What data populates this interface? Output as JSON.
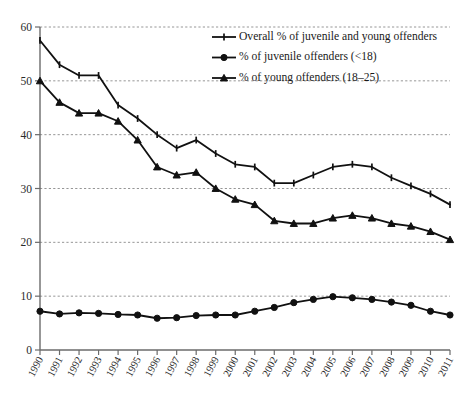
{
  "chart_data": {
    "type": "line",
    "title": "",
    "xlabel": "",
    "ylabel": "",
    "ylim": [
      0,
      60
    ],
    "ytick_values": [
      0,
      10,
      20,
      30,
      40,
      50,
      60
    ],
    "grid": "horizontal dashed gridlines at each y tick",
    "legend_position": "top-right inside plot area",
    "categories": [
      "1990",
      "1991",
      "1992",
      "1993",
      "1994",
      "1995",
      "1996",
      "1997",
      "1998",
      "1999",
      "2000",
      "2001",
      "2002",
      "2003",
      "2004",
      "2005",
      "2006",
      "2007",
      "2008",
      "2009",
      "2010",
      "2011"
    ],
    "series": [
      {
        "name": "Overall % of juvenile and young offenders",
        "marker": "plus",
        "values": [
          57.5,
          53.0,
          51.0,
          51.0,
          45.5,
          43.0,
          40.0,
          37.5,
          39.0,
          36.5,
          34.5,
          34.0,
          31.0,
          31.0,
          32.5,
          34.0,
          34.5,
          34.0,
          32.0,
          30.5,
          29.0,
          27.0
        ]
      },
      {
        "name": "% of juvenile offenders (<18)",
        "marker": "circle",
        "values": [
          7.2,
          6.7,
          6.9,
          6.8,
          6.6,
          6.5,
          5.9,
          6.0,
          6.4,
          6.5,
          6.5,
          7.2,
          7.9,
          8.8,
          9.4,
          9.9,
          9.7,
          9.4,
          8.9,
          8.3,
          7.2,
          6.5
        ]
      },
      {
        "name": "% of young offenders (18–25)",
        "marker": "triangle",
        "values": [
          50.0,
          46.0,
          44.0,
          44.0,
          42.5,
          39.0,
          34.0,
          32.5,
          33.0,
          30.0,
          28.0,
          27.0,
          24.0,
          23.5,
          23.5,
          24.5,
          25.0,
          24.5,
          23.5,
          23.0,
          22.0,
          20.5
        ]
      }
    ]
  },
  "legend": {
    "items": [
      {
        "label": "Overall % of juvenile and young offenders",
        "marker": "plus"
      },
      {
        "label": "% of juvenile offenders (<18)",
        "marker": "circle"
      },
      {
        "label": "% of young offenders (18–25)",
        "marker": "triangle"
      }
    ]
  },
  "colors": {
    "series": "#111111",
    "axis": "#6b6b6b",
    "grid": "#8a8a8a",
    "background": "#ffffff"
  }
}
